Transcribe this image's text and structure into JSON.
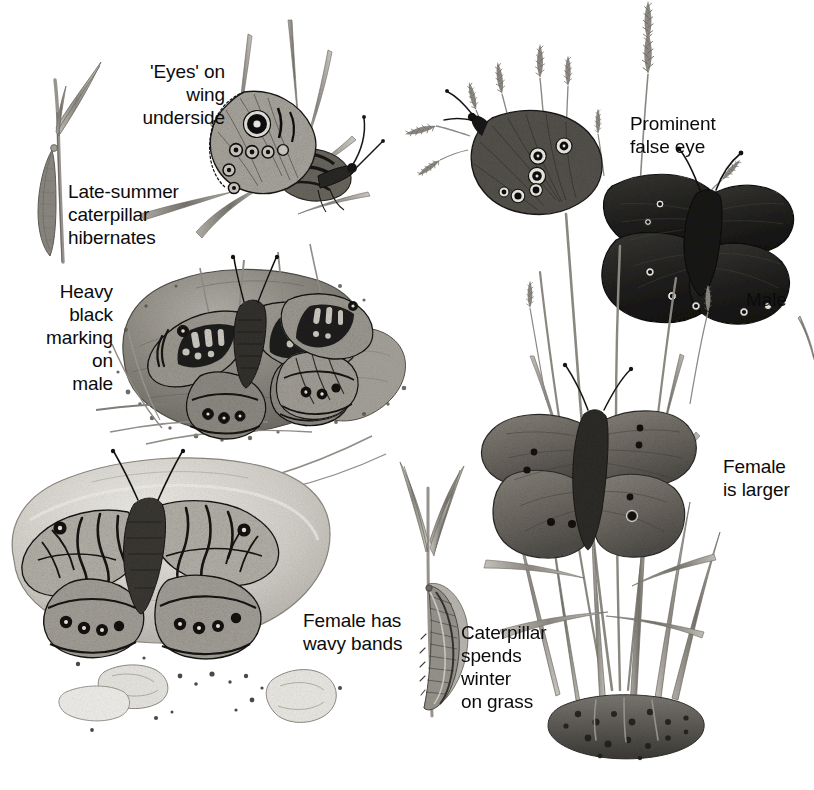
{
  "figure": {
    "kind": "field-guide-illustration",
    "medium": "grayscale pen-and-ink / pencil nature illustration",
    "background_color": "#ffffff",
    "ink_color": "#0b0b0b"
  },
  "labels": [
    {
      "id": "eyes-underside",
      "text": "'Eyes' on\nwing\nunderside",
      "align": "right"
    },
    {
      "id": "late-summer",
      "text": "Late-summer\ncaterpillar\nhibernates",
      "align": "left"
    },
    {
      "id": "heavy-black",
      "text": "Heavy\nblack\nmarking\non\nmale",
      "align": "right"
    },
    {
      "id": "female-wavy",
      "text": "Female has\nwavy bands",
      "align": "left"
    },
    {
      "id": "caterpillar-grass",
      "text": "Caterpillar\nspends\nwinter\non grass",
      "align": "left"
    },
    {
      "id": "prominent-eye",
      "text": "Prominent\nfalse eye",
      "align": "left"
    },
    {
      "id": "male",
      "text": "Male",
      "align": "left"
    },
    {
      "id": "female-larger",
      "text": "Female\nis larger",
      "align": "left"
    }
  ],
  "label_text": {
    "eyes_underside": "'Eyes' on\nwing\nunderside",
    "late_summer": "Late-summer\ncaterpillar\nhibernates",
    "heavy_black": "Heavy\nblack\nmarking\non\nmale",
    "female_wavy": "Female has\nwavy bands",
    "caterpillar_grass": "Caterpillar\nspends\nwinter\non grass",
    "prominent_eye": "Prominent\nfalse eye",
    "male": "Male",
    "female_larger": "Female\nis larger"
  },
  "subjects": {
    "left_group": {
      "species_common": "Wall Brown",
      "items": [
        {
          "id": "wall-underside",
          "name": "wall-brown-underside-on-grass",
          "note": "perched on grass blades, large white-pupilled eyespot on forewing"
        },
        {
          "id": "wall-caterpillar",
          "name": "wall-brown-caterpillar-on-blade",
          "note": "hibernating late-summer caterpillar on grass stem"
        },
        {
          "id": "wall-male-upper",
          "name": "wall-brown-male-upperside-on-stone",
          "note": "heavy black sex-brand marking across forewings"
        },
        {
          "id": "wall-male-second",
          "name": "wall-brown-second-male-upperside",
          "note": "smaller individual to the right on the same stone"
        },
        {
          "id": "wall-female-upper",
          "name": "wall-brown-female-upperside-on-stone",
          "note": "wavy bands, basking on pale stone"
        },
        {
          "id": "stones",
          "name": "stones-and-gravel",
          "note": "two large stones with scattered gravel and debris"
        }
      ]
    },
    "right_group": {
      "species_common": "Ringlet",
      "items": [
        {
          "id": "ringlet-underside",
          "name": "ringlet-underside-on-grass",
          "note": "white-ringed false eyespots on underside"
        },
        {
          "id": "ringlet-male",
          "name": "ringlet-male-upperside",
          "note": "very dark sooty-brown wings, small eyespots"
        },
        {
          "id": "ringlet-female",
          "name": "ringlet-female-upperside",
          "note": "larger, paler greyish-brown with more eyespots"
        },
        {
          "id": "grass-tussock",
          "name": "grass-tussock-with-seed-heads",
          "note": "tall grass clump with flowering seed heads and soil base"
        },
        {
          "id": "ringlet-caterpillar",
          "name": "ringlet-caterpillar-on-grass-blade",
          "note": "striped caterpillar clinging to a grass blade"
        }
      ]
    }
  },
  "palette": {
    "ink": "#0b0b0b",
    "paper": "#ffffff",
    "dark_wing": "#2b2a28",
    "mid_wing": "#6e6b66",
    "pale_wing": "#b9b5ad",
    "stone_dark": "#8d8a83",
    "stone_light": "#d5d2cb",
    "grass": "#9b9891",
    "grass_dark": "#6a675f",
    "soil": "#4a4843"
  }
}
